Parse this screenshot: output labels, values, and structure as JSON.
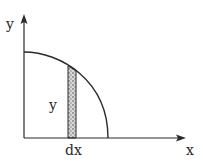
{
  "diagram": {
    "axes": {
      "x_label": "x",
      "y_label": "y"
    },
    "curve": {
      "type": "quarter-circle",
      "quadrant": "first"
    },
    "strip": {
      "height_label": "y",
      "width_label": "dx",
      "fill": "stippled"
    },
    "colors": {
      "line": "#2a2a2a",
      "strip_fill": "#9a9a9a",
      "background": "#ffffff"
    }
  }
}
